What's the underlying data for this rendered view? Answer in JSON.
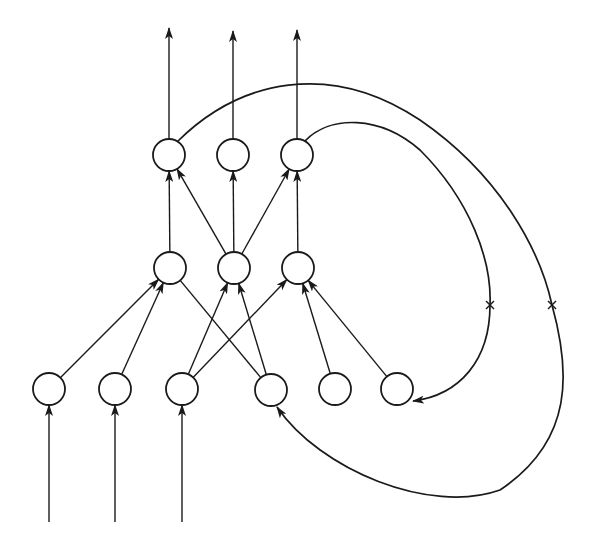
{
  "diagram": {
    "title": "",
    "type": "recurrent-neural-network",
    "colors": {
      "stroke": "#1a1a1a",
      "background": "#ffffff",
      "node_fill": "#ffffff"
    },
    "node_radius": 16,
    "nodes": [
      {
        "id": "O1",
        "layer": "output",
        "x": 169,
        "y": 155
      },
      {
        "id": "O2",
        "layer": "output",
        "x": 233,
        "y": 155
      },
      {
        "id": "O3",
        "layer": "output",
        "x": 297,
        "y": 155
      },
      {
        "id": "H1",
        "layer": "hidden",
        "x": 170,
        "y": 268
      },
      {
        "id": "H2",
        "layer": "hidden",
        "x": 234,
        "y": 268
      },
      {
        "id": "H3",
        "layer": "hidden",
        "x": 298,
        "y": 268
      },
      {
        "id": "I1",
        "layer": "input",
        "x": 49,
        "y": 389
      },
      {
        "id": "I2",
        "layer": "input",
        "x": 115,
        "y": 389
      },
      {
        "id": "I3",
        "layer": "input",
        "x": 182,
        "y": 389
      },
      {
        "id": "I4",
        "layer": "input",
        "x": 271,
        "y": 390
      },
      {
        "id": "I5",
        "layer": "input",
        "x": 335,
        "y": 389
      },
      {
        "id": "I6",
        "layer": "input",
        "x": 397,
        "y": 389
      }
    ],
    "external_inputs": [
      {
        "to": "I1",
        "from_y": 522
      },
      {
        "to": "I2",
        "from_y": 522
      },
      {
        "to": "I3",
        "from_y": 522
      }
    ],
    "external_outputs": [
      {
        "from": "O1",
        "to_y": 28
      },
      {
        "from": "O2",
        "to_y": 31
      },
      {
        "from": "O3",
        "to_y": 30
      }
    ],
    "edges": [
      {
        "from": "H1",
        "to": "O1",
        "arrow": true
      },
      {
        "from": "H2",
        "to": "O1",
        "arrow": true
      },
      {
        "from": "H2",
        "to": "O2",
        "arrow": true
      },
      {
        "from": "H2",
        "to": "O3",
        "arrow": true
      },
      {
        "from": "H3",
        "to": "O3",
        "arrow": true
      },
      {
        "from": "I1",
        "to": "H1",
        "arrow": true
      },
      {
        "from": "I2",
        "to": "H1",
        "arrow": true
      },
      {
        "from": "I4",
        "to": "H1",
        "arrow": false
      },
      {
        "from": "I3",
        "to": "H2",
        "arrow": true
      },
      {
        "from": "I4",
        "to": "H2",
        "arrow": true
      },
      {
        "from": "I3",
        "to": "H3",
        "arrow": true
      },
      {
        "from": "I5",
        "to": "H3",
        "arrow": true
      },
      {
        "from": "I6",
        "to": "H3",
        "arrow": true
      }
    ],
    "recurrent_connections": [
      {
        "from": "O1",
        "to": "I4",
        "label": "outer feedback loop",
        "cut_mark": "×",
        "cut_mark_at": [
          552,
          305
        ],
        "path": "M 178 141 C 240 80, 330 60, 420 120 C 500 175, 540 250, 552 305 C 570 370, 575 440, 500 490 C 430 515, 320 470, 277 407"
      },
      {
        "from": "O3",
        "to": "I6",
        "label": "inner feedback loop",
        "cut_mark": "×",
        "cut_mark_at": [
          490,
          305
        ],
        "path": "M 305 141 C 330 115, 380 115, 420 150 C 470 200, 492 260, 490 305 C 490 360, 460 395, 413 401"
      }
    ]
  }
}
